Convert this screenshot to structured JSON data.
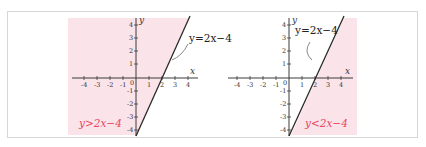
{
  "colors": {
    "shade": "#fbe3ea",
    "axis": "#3a3a3a",
    "line": "#2a2a2a",
    "inequality_label": "#e5475f",
    "frame_border": "#d6d6d6"
  },
  "graphs": [
    {
      "id": "left",
      "axis_x_label": "x",
      "axis_y_label": "y",
      "x_ticks": [
        "-4",
        "-3",
        "-2",
        "-1",
        "1",
        "2",
        "3",
        "4"
      ],
      "y_ticks": [
        "4",
        "3",
        "2",
        "1",
        "-1",
        "-2",
        "-3",
        "-4"
      ],
      "origin_label": "0",
      "line_label": "y=2x−4",
      "inequality": "y>2x−4",
      "shaded_side": "above-left"
    },
    {
      "id": "right",
      "axis_x_label": "x",
      "axis_y_label": "y",
      "x_ticks": [
        "-4",
        "-3",
        "-2",
        "-1",
        "1",
        "2",
        "3",
        "4"
      ],
      "y_ticks": [
        "4",
        "3",
        "2",
        "1",
        "-1",
        "-2",
        "-3",
        "-4"
      ],
      "origin_label": "0",
      "line_label": "y=2x−4",
      "inequality": "y<2x−4",
      "shaded_side": "below-right"
    }
  ]
}
